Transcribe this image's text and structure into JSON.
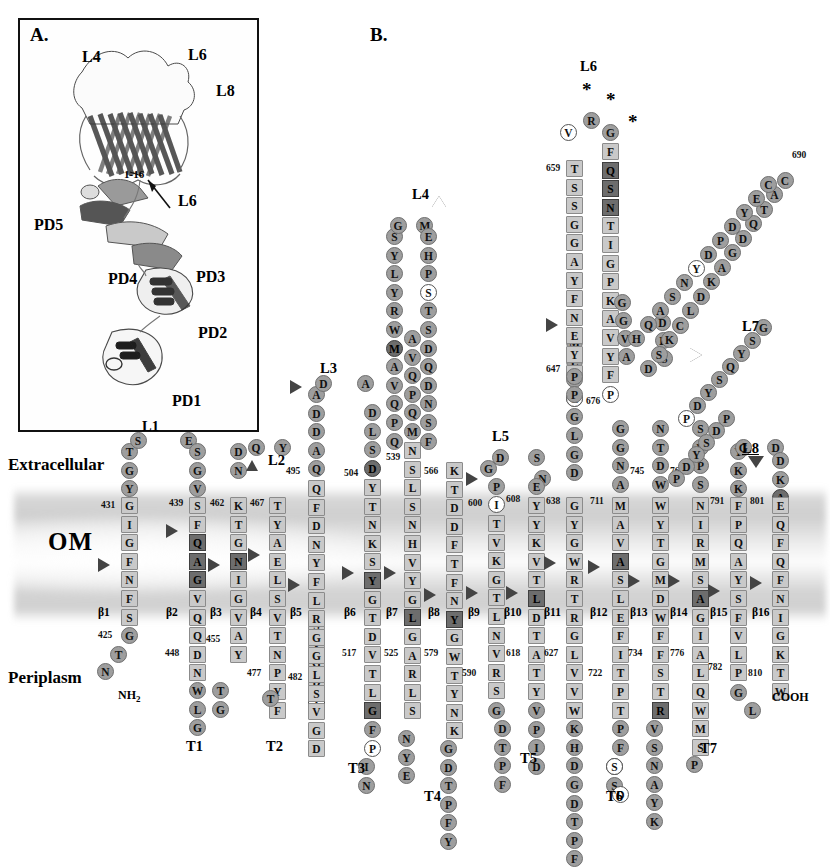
{
  "figure": {
    "panel_a_label": "A.",
    "panel_b_label": "B.",
    "panel_a_structure_labels": [
      {
        "text": "L4",
        "x": 62,
        "y": 28
      },
      {
        "text": "L6",
        "x": 168,
        "y": 26
      },
      {
        "text": "L8",
        "x": 196,
        "y": 62
      },
      {
        "text": "PD5",
        "x": 14,
        "y": 196
      },
      {
        "text": "PD4",
        "x": 88,
        "y": 250
      },
      {
        "text": "PD3",
        "x": 176,
        "y": 248
      },
      {
        "text": "PD2",
        "x": 178,
        "y": 304
      },
      {
        "text": "PD1",
        "x": 152,
        "y": 372
      },
      {
        "text": "L6",
        "x": 158,
        "y": 172
      },
      {
        "text": "1-16",
        "x": 104,
        "y": 148
      }
    ]
  },
  "membrane": {
    "om_label": "OM",
    "extracellular_label": "Extracellular",
    "periplasm_label": "Periplasm"
  },
  "termini": {
    "n_term": "NH",
    "n_term_sub": "2",
    "c_term": "COOH"
  },
  "strand_labels": [
    "β1",
    "β2",
    "β3",
    "β4",
    "β5",
    "β6",
    "β7",
    "β8",
    "β9",
    "β10",
    "β11",
    "β12",
    "β13",
    "β14",
    "β15",
    "β16"
  ],
  "loop_labels": [
    "L1",
    "L2",
    "L3",
    "L4",
    "L5",
    "L6",
    "L7",
    "L8"
  ],
  "turn_labels": [
    "T1",
    "T2",
    "T3",
    "T4",
    "T5",
    "T6",
    "T7"
  ],
  "residue_numbers": [
    425,
    431,
    439,
    448,
    455,
    462,
    467,
    477,
    482,
    495,
    504,
    517,
    525,
    539,
    566,
    579,
    590,
    600,
    608,
    618,
    627,
    638,
    647,
    659,
    676,
    690,
    711,
    722,
    734,
    745,
    765,
    776,
    782,
    791,
    801,
    810
  ],
  "asterisks": 3,
  "colors": {
    "circle_fill": "#9e9e9e",
    "square_fill": "#c9c9c9",
    "dark_fill": "#6d6d6d",
    "white_fill": "#ffffff",
    "membrane": "#969696",
    "text": "#111111"
  },
  "columns": [
    {
      "name": "b1",
      "kind": "strand",
      "label": "β1",
      "label_x": 78,
      "label_y": 612,
      "x": 121,
      "y_top": 497,
      "letters": "GIGFNFS",
      "marker": {
        "type": "right",
        "y": 565
      },
      "num_start": {
        "value": "431",
        "x": 101,
        "y": 501
      }
    },
    {
      "name": "b1_top",
      "kind": "coil",
      "x": 121,
      "y_top": 445,
      "letters": "TGY",
      "dir": "up",
      "shape": "circle"
    },
    {
      "name": "b1_bot",
      "kind": "coil",
      "x": 121,
      "y_top": 636,
      "letters": "GTN",
      "dir": "down",
      "shape": "circle",
      "num": {
        "value": "425",
        "x": 100,
        "y": 639
      }
    },
    {
      "name": "l1_top",
      "kind": "loop",
      "letters": "ES",
      "x": 142,
      "y": 452
    },
    {
      "name": "b2_top",
      "kind": "coil",
      "x": 189,
      "y_top": 452,
      "letters": "SGV",
      "dir": "down",
      "shape": "circle"
    },
    {
      "name": "b2",
      "kind": "strand",
      "label": "β2",
      "label_x": 166,
      "label_y": 612,
      "x": 189,
      "y_top": 497,
      "letters": "SFQAGVQQDN",
      "marker": {
        "type": "right",
        "y": 530
      },
      "num_start": {
        "value": "439",
        "x": 169,
        "y": 501
      },
      "num_end": {
        "value": "448",
        "x": 166,
        "y": 650
      },
      "dark": [
        2,
        3,
        4
      ]
    },
    {
      "name": "b2_bot",
      "kind": "coil",
      "x": 189,
      "y_top": 670,
      "letters": "WLG",
      "dir": "down",
      "shape": "circle"
    },
    {
      "name": "t1",
      "kind": "turn",
      "label": "T1",
      "x": 192,
      "y": 742
    },
    {
      "name": "b3_bot",
      "kind": "coil",
      "x": 230,
      "y_top": 670,
      "letters": "TG",
      "dir": "up",
      "shape": "circle"
    },
    {
      "name": "b3",
      "kind": "strand",
      "label": "β3",
      "label_x": 210,
      "label_y": 612,
      "x": 230,
      "y_top": 497,
      "letters": "KTGNIGVAY",
      "marker": {
        "type": "right",
        "y": 565
      },
      "num_start": {
        "value": "462",
        "x": 210,
        "y": 501
      },
      "num_end": {
        "value": "455",
        "x": 207,
        "y": 637
      },
      "dark": [
        3
      ]
    },
    {
      "name": "b3_top",
      "kind": "coil",
      "x": 230,
      "y_top": 452,
      "letters": "DN",
      "dir": "down",
      "shape": "circle"
    },
    {
      "name": "l2_top",
      "kind": "loop",
      "letters": "YQ",
      "x": 252,
      "y": 470
    },
    {
      "name": "b4",
      "kind": "strand",
      "label": "β4",
      "label_x": 252,
      "label_y": 612,
      "x": 269,
      "y_top": 497,
      "letters": "TYAELSVTNPYF",
      "marker": {
        "type": "right",
        "y": 552
      },
      "num_start": {
        "value": "467",
        "x": 252,
        "y": 501
      },
      "num_end": {
        "value": "477",
        "x": 249,
        "y": 672
      }
    },
    {
      "name": "b4_bot",
      "kind": "coil",
      "x": 269,
      "y_top": 690,
      "letters": "T",
      "dir": "down",
      "shape": "circle"
    },
    {
      "name": "t2",
      "kind": "turn",
      "label": "T2",
      "x": 272,
      "y": 742
    },
    {
      "name": "b5",
      "kind": "strand",
      "label": "β5",
      "label_x": 292,
      "label_y": 612,
      "x": 308,
      "y_top": 497,
      "letters": "SVGDV",
      "marker": null,
      "num_start": {
        "value": "482",
        "x": 288,
        "y": 675
      }
    },
    {
      "name": "b5_up",
      "kind": "strand",
      "x": 308,
      "y_top": 497,
      "letters": "QFDNYFLRGGLSVGD",
      "label": "β5",
      "marker": {
        "type": "right",
        "y": 582
      },
      "num_start": {
        "value": "495",
        "x": 288,
        "y": 470
      }
    },
    {
      "name": "l3",
      "kind": "loop",
      "label": "L3",
      "x": 318,
      "y": 362
    },
    {
      "name": "t3",
      "kind": "turn",
      "label": "T3",
      "x": 352,
      "y": 762
    },
    {
      "name": "b6",
      "kind": "strand",
      "label": "β6",
      "label_x": 346,
      "label_y": 612,
      "x": 364,
      "y_top": 497,
      "letters": "YTNKSYGTDVTLG",
      "marker": {
        "type": "right",
        "y": 568
      },
      "num_start": {
        "value": "504",
        "x": 344,
        "y": 470
      },
      "num_end": {
        "value": "517",
        "x": 344,
        "y": 652
      }
    },
    {
      "name": "b7",
      "kind": "strand",
      "label": "β7",
      "label_x": 386,
      "label_y": 612,
      "x": 404,
      "y_top": 497,
      "letters": "SLSNHVYGLGARLS",
      "marker": {
        "type": "right",
        "y": 568
      },
      "num_start": {
        "value": "539",
        "x": 384,
        "y": 470
      },
      "num_end": {
        "value": "525",
        "x": 384,
        "y": 652
      }
    },
    {
      "name": "l4",
      "kind": "loop",
      "label": "L4",
      "x": 417,
      "y": 190
    },
    {
      "name": "t4",
      "kind": "turn",
      "label": "T4",
      "x": 428,
      "y": 790
    },
    {
      "name": "b8",
      "kind": "strand",
      "label": "β8",
      "label_x": 428,
      "label_y": 612,
      "x": 446,
      "y_top": 497,
      "letters": "KTDDFTFNYGWTYNK",
      "marker": {
        "type": "right",
        "y": 592
      },
      "num_start": {
        "value": "566",
        "x": 426,
        "y": 470
      },
      "num_end": {
        "value": "579",
        "x": 426,
        "y": 652
      }
    },
    {
      "name": "l5",
      "kind": "loop",
      "label": "L5",
      "x": 495,
      "y": 432
    },
    {
      "name": "b9",
      "kind": "strand",
      "label": "β9",
      "label_x": 470,
      "label_y": 612,
      "x": 488,
      "y_top": 497,
      "letters": "TVKGTLNVRSG",
      "marker": {
        "type": "right",
        "y": 590
      },
      "num_start": {
        "value": "600",
        "x": 468,
        "y": 500
      },
      "num_end": {
        "value": "590",
        "x": 466,
        "y": 672
      }
    },
    {
      "name": "t5",
      "kind": "turn",
      "label": "T5",
      "x": 522,
      "y": 752
    },
    {
      "name": "b10",
      "kind": "strand",
      "label": "β10",
      "label_x": 508,
      "label_y": 612,
      "x": 528,
      "y_top": 497,
      "letters": "YYKVTLDTATYVPID",
      "marker": {
        "type": "right",
        "y": 590
      },
      "num_start": {
        "value": "608",
        "x": 506,
        "y": 470
      },
      "num_end": {
        "value": "618",
        "x": 504,
        "y": 652
      }
    },
    {
      "name": "b11",
      "kind": "strand",
      "label": "β11",
      "label_x": 548,
      "label_y": 612,
      "x": 566,
      "y_top": 497,
      "letters": "GYGWRTRGLVVWKHD",
      "marker": {
        "type": "right",
        "y": 560
      },
      "num_start": {
        "value": "638",
        "x": 546,
        "y": 500
      },
      "num_end": {
        "value": "627",
        "x": 544,
        "y": 652
      }
    },
    {
      "name": "l6",
      "kind": "loop",
      "label": "L6",
      "x": 584,
      "y": 60
    },
    {
      "name": "t6",
      "kind": "turn",
      "label": "T6",
      "x": 610,
      "y": 790
    },
    {
      "name": "b12",
      "kind": "strand",
      "label": "β12",
      "label_x": 594,
      "label_y": 612,
      "x": 612,
      "y_top": 497,
      "letters": "MAVASLEFITPTPF",
      "marker": {
        "type": "right",
        "y": 565
      },
      "num_start": {
        "value": "711",
        "x": 590,
        "y": 500
      },
      "num_end": {
        "value": "722",
        "x": 590,
        "y": 672
      }
    },
    {
      "name": "b13",
      "kind": "strand",
      "label": "β13",
      "label_x": 634,
      "label_y": 612,
      "x": 652,
      "y_top": 497,
      "letters": "WYTGMDWFFSTR",
      "marker": {
        "type": "right",
        "y": 578
      },
      "num_start": {
        "value": "745",
        "x": 630,
        "y": 470
      },
      "num_end": {
        "value": "734",
        "x": 630,
        "y": 652
      }
    },
    {
      "name": "b14",
      "kind": "strand",
      "label": "β14",
      "label_x": 674,
      "label_y": 612,
      "x": 692,
      "y_top": 497,
      "letters": "NIRMSAGIALQWMS",
      "marker": {
        "type": "right",
        "y": 578
      },
      "num_start": {
        "value": "765",
        "x": 670,
        "y": 470
      },
      "num_end": {
        "value": "776",
        "x": 670,
        "y": 652
      }
    },
    {
      "name": "t7",
      "kind": "turn",
      "label": "T7",
      "x": 706,
      "y": 742
    },
    {
      "name": "b15",
      "kind": "strand",
      "label": "β15",
      "label_x": 712,
      "label_y": 612,
      "x": 730,
      "y_top": 497,
      "letters": "FPQAYSFVLP",
      "marker": {
        "type": "right",
        "y": 588
      },
      "num_start": {
        "value": "791",
        "x": 708,
        "y": 500
      },
      "num_end": {
        "value": "782",
        "x": 708,
        "y": 660
      }
    },
    {
      "name": "l8",
      "kind": "loop",
      "label": "L8",
      "x": 747,
      "y": 442
    },
    {
      "name": "b16",
      "kind": "strand",
      "label": "β16",
      "label_x": 754,
      "label_y": 612,
      "x": 772,
      "y_top": 497,
      "letters": "EQFQFNIGKTW",
      "marker": {
        "type": "right",
        "y": 580
      },
      "num_start": {
        "value": "801",
        "x": 750,
        "y": 500
      },
      "num_end": {
        "value": "810",
        "x": 748,
        "y": 672
      }
    },
    {
      "name": "l7",
      "kind": "loop",
      "label": "L7",
      "x": 742,
      "y": 318
    }
  ]
}
